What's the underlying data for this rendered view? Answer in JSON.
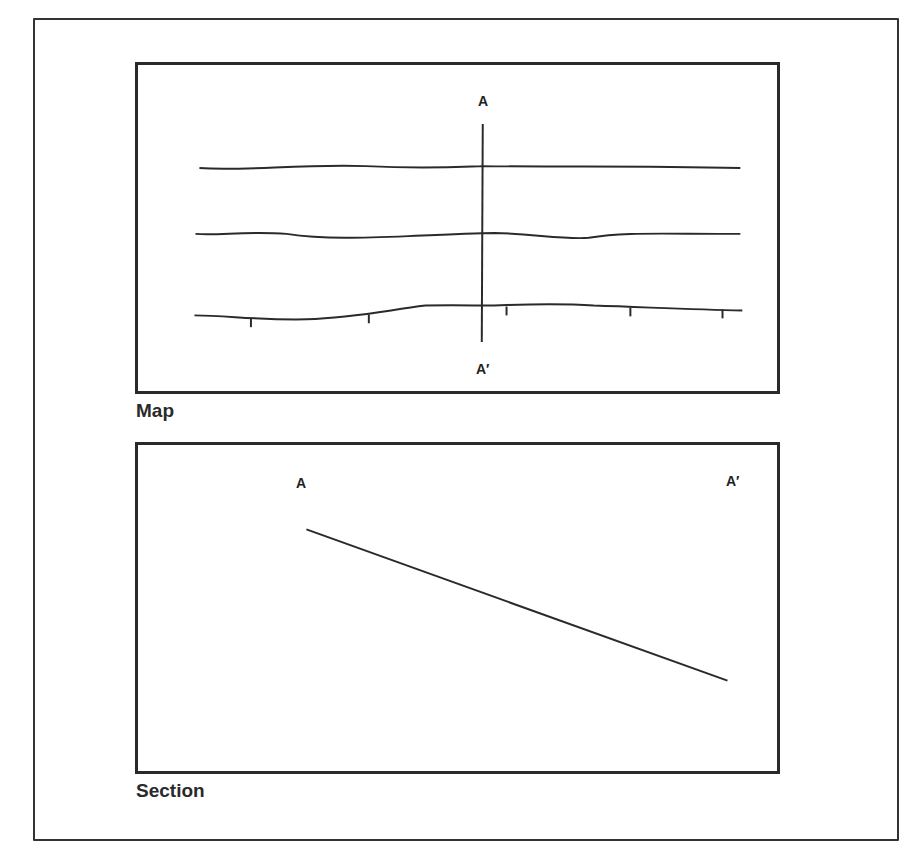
{
  "figure": {
    "map": {
      "caption": "Map",
      "line_label_top": "A",
      "line_label_bottom": "A′",
      "contour_count": 3,
      "contours": [
        {
          "y": 105
        },
        {
          "y": 172
        },
        {
          "y": 250,
          "has_ticks": true,
          "tick_count": 5
        }
      ]
    },
    "section": {
      "caption": "Section",
      "label_left": "A",
      "label_right": "A′",
      "profile_line": {
        "from": [
          170,
          86
        ],
        "to": [
          595,
          240
        ]
      }
    },
    "colors": {
      "ink": "#2a2a2a",
      "background": "#ffffff"
    }
  }
}
